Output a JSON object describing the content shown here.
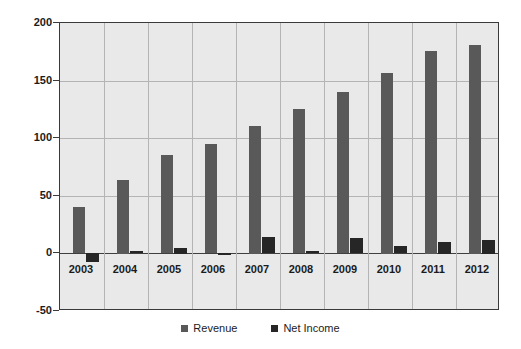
{
  "chart_data": {
    "type": "bar",
    "title": "",
    "xlabel": "",
    "ylabel": "",
    "categories": [
      "2003",
      "2004",
      "2005",
      "2006",
      "2007",
      "2008",
      "2009",
      "2010",
      "2011",
      "2012"
    ],
    "series": [
      {
        "name": "Revenue",
        "color": "#595959",
        "values": [
          40,
          64,
          85,
          95,
          111,
          125,
          140,
          157,
          176,
          181
        ]
      },
      {
        "name": "Net Income",
        "color": "#262626",
        "values": [
          -8,
          2,
          5,
          -1,
          14,
          2,
          13,
          6,
          10,
          12
        ]
      }
    ],
    "ylim": [
      -50,
      200
    ],
    "yticks": [
      -50,
      0,
      50,
      100,
      150,
      200
    ],
    "ytick_labels": [
      "-50",
      "0",
      "50",
      "100",
      "150",
      "200"
    ],
    "grid": true,
    "grid_axis": "both",
    "legend_position": "bottom",
    "plot_background": "#e9e9e9",
    "grid_color": "#b4b4b4",
    "axis_color": "#3a3a3a"
  }
}
